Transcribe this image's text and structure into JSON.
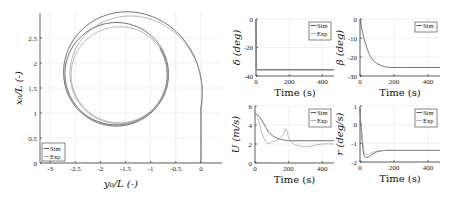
{
  "chart_data": [
    {
      "id": "trajectory",
      "type": "line",
      "title": "",
      "xlabel": "y0/L (-)",
      "ylabel": "x0/L (-)",
      "xlim": [
        -3.2,
        0.42
      ],
      "ylim": [
        0,
        3.0
      ],
      "xticks": [
        -3,
        -2.5,
        -2,
        -1.5,
        -1,
        -0.5,
        0
      ],
      "xtick_labels": [
        "-3",
        "-2.5",
        "-2",
        "-1.5",
        "-1",
        "-0.5",
        "0"
      ],
      "yticks": [
        0,
        0.5,
        1,
        1.5,
        2,
        2.5
      ],
      "ytick_labels": [
        "0",
        "0.5",
        "1",
        "1.5",
        "2",
        "2.5"
      ],
      "grid": true,
      "legend_position": "lower left",
      "legend": [
        "Sim",
        "Exp"
      ],
      "series": [
        {
          "name": "Sim",
          "description": "starts at (0,0), rises vertically then curls left into a circle of radius ~1.05 centered near (-1.68, 1.78)",
          "center": [
            -1.68,
            1.78
          ],
          "radius": 1.06
        },
        {
          "name": "Exp",
          "description": "similar spiral, slightly smaller circle radius ~0.98 centered near (-1.62, 1.76)",
          "center": [
            -1.62,
            1.76
          ],
          "radius": 0.99
        }
      ]
    },
    {
      "id": "delta",
      "type": "line",
      "xlabel": "Time (s)",
      "ylabel": "δ (deg)",
      "xlim": [
        0,
        470
      ],
      "ylim": [
        -40,
        0
      ],
      "xticks": [
        0,
        200,
        400
      ],
      "yticks": [
        -40,
        -20,
        0
      ],
      "grid": true,
      "legend": [
        "Sim",
        "Exp"
      ],
      "legend_position": "upper right",
      "series": [
        {
          "name": "Sim",
          "x": [
            0,
            2,
            470
          ],
          "y": [
            0,
            -35.5,
            -35.5
          ]
        },
        {
          "name": "Exp",
          "x": [
            0,
            2,
            470
          ],
          "y": [
            0,
            -36,
            -36
          ]
        }
      ]
    },
    {
      "id": "beta",
      "type": "line",
      "xlabel": "Time (s)",
      "ylabel": "β (deg)",
      "xlim": [
        0,
        470
      ],
      "ylim": [
        -30,
        0
      ],
      "xticks": [
        0,
        200,
        400
      ],
      "yticks": [
        -30,
        -20,
        -10,
        0
      ],
      "grid": true,
      "legend": [
        "Sim"
      ],
      "legend_position": "upper right",
      "series": [
        {
          "name": "Sim",
          "x": [
            0,
            10,
            25,
            50,
            75,
            100,
            150,
            200,
            300,
            470
          ],
          "y": [
            0,
            -5,
            -11,
            -17.5,
            -21.5,
            -23.5,
            -25.2,
            -25.5,
            -25.5,
            -25.5
          ]
        }
      ]
    },
    {
      "id": "U",
      "type": "line",
      "xlabel": "Time (s)",
      "ylabel": "U (m/s)",
      "xlim": [
        0,
        470
      ],
      "ylim": [
        0,
        6
      ],
      "xticks": [
        0,
        200,
        400
      ],
      "yticks": [
        0,
        2,
        4,
        6
      ],
      "grid": true,
      "legend": [
        "Sim",
        "Exp"
      ],
      "legend_position": "upper right",
      "series": [
        {
          "name": "Sim",
          "x": [
            0,
            20,
            50,
            80,
            110,
            150,
            200,
            300,
            470
          ],
          "y": [
            5.2,
            5.0,
            4.2,
            3.3,
            2.8,
            2.5,
            2.35,
            2.35,
            2.35
          ]
        },
        {
          "name": "Exp",
          "x": [
            0,
            15,
            40,
            70,
            100,
            140,
            170,
            185,
            200,
            230,
            300,
            400,
            470
          ],
          "y": [
            5.1,
            4.8,
            3.2,
            2.1,
            2.2,
            2.5,
            3.0,
            3.6,
            2.6,
            2.0,
            1.7,
            2.0,
            2.0
          ]
        }
      ]
    },
    {
      "id": "r",
      "type": "line",
      "xlabel": "Time (s)",
      "ylabel": "r (deg/s)",
      "xlim": [
        0,
        470
      ],
      "ylim": [
        -2,
        1
      ],
      "xticks": [
        0,
        200,
        400
      ],
      "yticks": [
        -2,
        -1,
        0,
        1
      ],
      "grid": true,
      "legend": [
        "Sim",
        "Exp"
      ],
      "legend_position": "upper right",
      "series": [
        {
          "name": "Sim",
          "x": [
            0,
            5,
            20,
            40,
            70,
            100,
            150,
            200,
            470
          ],
          "y": [
            0.9,
            0,
            -1.5,
            -1.75,
            -1.6,
            -1.45,
            -1.38,
            -1.38,
            -1.38
          ]
        },
        {
          "name": "Exp",
          "x": [
            0,
            5,
            20,
            40,
            70,
            100,
            150,
            200,
            470
          ],
          "y": [
            0.9,
            0,
            -1.3,
            -1.6,
            -1.5,
            -1.42,
            -1.38,
            -1.38,
            -1.38
          ]
        }
      ]
    }
  ],
  "labels": {
    "traj_xlabel": "y₀/L (-)",
    "traj_ylabel": "x₀/L (-)",
    "time_label": "Time (s)",
    "delta_ylabel": "δ (deg)",
    "beta_ylabel": "β (deg)",
    "U_ylabel": "U (m/s)",
    "r_ylabel": "r (deg/s)",
    "legend_sim": "Sim",
    "legend_exp": "Exp"
  },
  "colors": {
    "sim": "#333333",
    "exp": "#9a9a9a",
    "grid": "#e6e6e6",
    "axis": "#222222"
  }
}
